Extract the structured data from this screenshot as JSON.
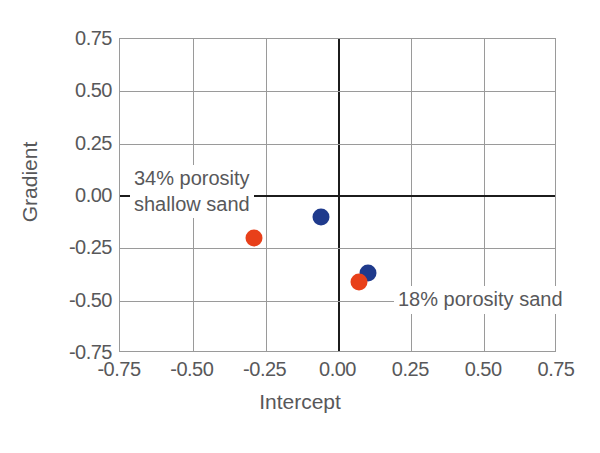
{
  "chart_data": {
    "type": "scatter",
    "title": "",
    "xlabel": "Intercept",
    "ylabel": "Gradient",
    "xlim": [
      -0.75,
      0.75
    ],
    "ylim": [
      -0.75,
      0.75
    ],
    "xticks": [
      "-0.75",
      "-0.50",
      "-0.25",
      "0.00",
      "0.25",
      "0.50",
      "0.75"
    ],
    "yticks": [
      "0.75",
      "0.50",
      "0.25",
      "0.00",
      "-0.25",
      "-0.50",
      "-0.75"
    ],
    "xtick_values": [
      -0.75,
      -0.5,
      -0.25,
      0,
      0.25,
      0.5,
      0.75
    ],
    "ytick_values": [
      0.75,
      0.5,
      0.25,
      0,
      -0.25,
      -0.5,
      -0.75
    ],
    "grid": true,
    "legend": "none",
    "zero_axes": true,
    "series": [
      {
        "name": "blue",
        "color": "#1f3a8c",
        "points": [
          {
            "x": -0.06,
            "y": -0.1
          },
          {
            "x": 0.1,
            "y": -0.37
          }
        ]
      },
      {
        "name": "orange",
        "color": "#e8401a",
        "points": [
          {
            "x": -0.29,
            "y": -0.2
          },
          {
            "x": 0.07,
            "y": -0.41
          }
        ]
      }
    ],
    "annotations": [
      {
        "text_line1": "34% porosity",
        "text_line2": "shallow sand",
        "x": -0.33,
        "y": 0.1
      },
      {
        "text_line1": "18% porosity sand",
        "text_line2": "",
        "x": 0.19,
        "y": -0.46
      }
    ]
  },
  "axes": {
    "x_title": "Intercept",
    "y_title": "Gradient"
  },
  "annotation_shallow": {
    "line1": "34% porosity",
    "line2": "shallow sand"
  },
  "annotation_deep": {
    "line1": "18% porosity sand"
  },
  "colors": {
    "blue": "#1f3a8c",
    "orange": "#e8401a",
    "grid": "#9a9a9a",
    "axis": "#1c1c1c",
    "text": "#58585a"
  }
}
